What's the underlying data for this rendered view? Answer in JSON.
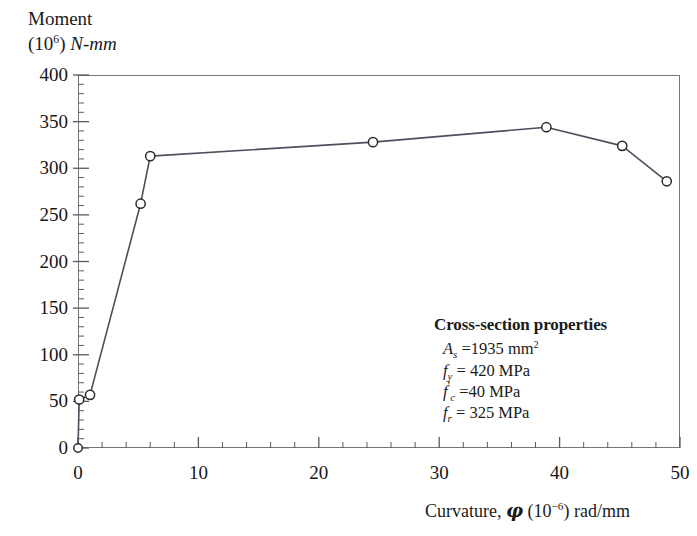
{
  "chart_data": {
    "type": "line",
    "title": "",
    "ylabel": "Moment (10^6) N-mm",
    "ylabel_main": "Moment",
    "ylabel_unit_prefix": "(10",
    "ylabel_unit_exp": "6",
    "ylabel_unit_suffix": ") ",
    "ylabel_unit_italic": "N-mm",
    "xlabel": "Curvature, φ (10−6) rad/mm",
    "xlabel_prefix": "Curvature, ",
    "xlabel_symbol": "φ",
    "xlabel_paren_open": " (10",
    "xlabel_exp": "−6",
    "xlabel_paren_close": ") rad/mm",
    "xlim": [
      0,
      50
    ],
    "ylim": [
      0,
      400
    ],
    "x_major_ticks": [
      0,
      10,
      20,
      30,
      40,
      50
    ],
    "x_minor_step": 2,
    "y_major_ticks": [
      0,
      50,
      100,
      150,
      200,
      250,
      300,
      350,
      400
    ],
    "y_minor_step": 10,
    "grid": false,
    "legend": null,
    "marker": "open-circle",
    "line_color": "#4d4f5e",
    "marker_edge_color": "#2b2b2b",
    "marker_face_color": "#ffffff",
    "frame_color": "#767676",
    "series": [
      {
        "name": "Moment-curvature",
        "x": [
          0.0,
          0.1,
          1.0,
          5.2,
          6.0,
          24.5,
          38.9,
          45.2,
          48.9
        ],
        "y": [
          0,
          52,
          57,
          262,
          313,
          328,
          344,
          324,
          286
        ]
      }
    ],
    "annotations": {
      "title": "Cross-section properties",
      "rows": [
        {
          "symbol": "A",
          "subscript": "s",
          "prime": "",
          "equals": " =",
          "value": "1935 mm",
          "exponent": "2"
        },
        {
          "symbol": "f",
          "subscript": "y",
          "prime": "",
          "equals": " = ",
          "value": "420 MPa",
          "exponent": ""
        },
        {
          "symbol": "f",
          "subscript": "c",
          "prime": "'",
          "equals": " =",
          "value": "40 MPa",
          "exponent": ""
        },
        {
          "symbol": "f",
          "subscript": "r",
          "prime": "",
          "equals": " = ",
          "value": "325 MPa",
          "exponent": ""
        }
      ]
    }
  }
}
